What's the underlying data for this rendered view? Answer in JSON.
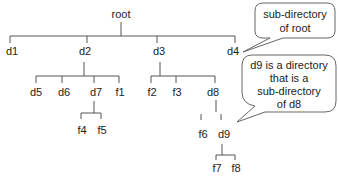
{
  "diagram": {
    "type": "directory-tree",
    "nodes": {
      "root": "root",
      "d1": "d1",
      "d2": "d2",
      "d3": "d3",
      "d4": "d4",
      "d5": "d5",
      "d6": "d6",
      "d7": "d7",
      "f1": "f1",
      "f2": "f2",
      "f3": "f3",
      "d8": "d8",
      "f4": "f4",
      "f5": "f5",
      "f6": "f6",
      "d9": "d9",
      "f7": "f7",
      "f8": "f8"
    },
    "edges": [
      [
        "root",
        "d1"
      ],
      [
        "root",
        "d2"
      ],
      [
        "root",
        "d3"
      ],
      [
        "root",
        "d4"
      ],
      [
        "d2",
        "d5"
      ],
      [
        "d2",
        "d6"
      ],
      [
        "d2",
        "d7"
      ],
      [
        "d2",
        "f1"
      ],
      [
        "d7",
        "f4"
      ],
      [
        "d7",
        "f5"
      ],
      [
        "d3",
        "f2"
      ],
      [
        "d3",
        "f3"
      ],
      [
        "d3",
        "d8"
      ],
      [
        "d8",
        "f6"
      ],
      [
        "d8",
        "d9"
      ],
      [
        "d9",
        "f7"
      ],
      [
        "d9",
        "f8"
      ]
    ],
    "callouts": [
      {
        "target": "d4",
        "lines": [
          "sub-directory",
          "of root"
        ]
      },
      {
        "target": "d9",
        "lines": [
          "d9 is a directory",
          "that is a",
          "sub-directory",
          "of d8"
        ]
      }
    ]
  }
}
